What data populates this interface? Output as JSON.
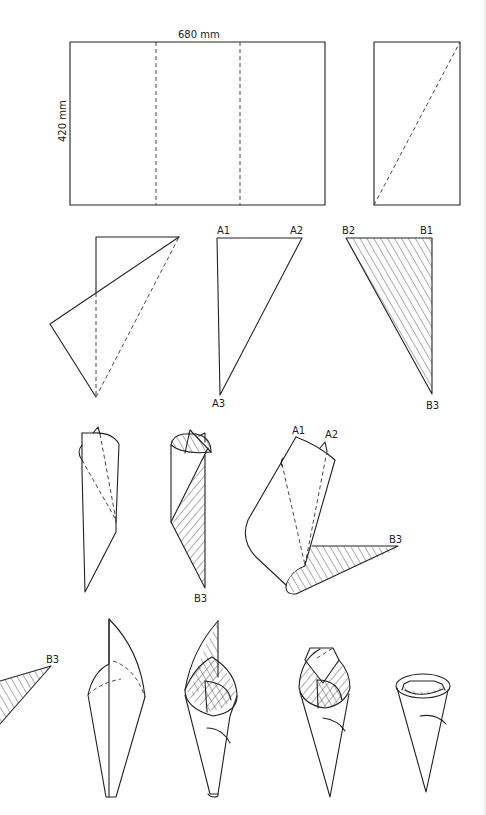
{
  "diagram": {
    "sheet": {
      "width_label": "680 mm",
      "height_label": "420 mm"
    },
    "steps": [
      {
        "id": 1,
        "description": "Sheet divided into thirds by two vertical dashed fold lines"
      },
      {
        "id": 2,
        "description": "One third strip with dashed diagonal fold line"
      },
      {
        "id": 3,
        "description": "Strip folded along diagonal"
      },
      {
        "id": 4,
        "description": "Triangle A",
        "labels": [
          "A1",
          "A2",
          "A3"
        ]
      },
      {
        "id": 5,
        "description": "Hatched triangle B",
        "labels": [
          "B2",
          "B1",
          "B3"
        ]
      },
      {
        "id": 6,
        "description": "Triangle A rolled into a cone"
      },
      {
        "id": 7,
        "description": "Triangle B wrapped around cone",
        "labels": [
          "B3"
        ]
      },
      {
        "id": 8,
        "description": "Cone opened showing A1, A2 and tail B3",
        "labels": [
          "A1",
          "A2",
          "B3"
        ]
      },
      {
        "id": 9,
        "description": "Tail B3 continues wrapping",
        "labels": [
          "B3"
        ]
      },
      {
        "id": 10,
        "description": "Cone with flap upright"
      },
      {
        "id": 11,
        "description": "Flap folded inside cone"
      },
      {
        "id": 12,
        "description": "Top flaps tucked"
      },
      {
        "id": 13,
        "description": "Finished cone"
      }
    ],
    "labels": {
      "a1": "A1",
      "a2": "A2",
      "a3": "A3",
      "b1": "B1",
      "b2": "B2",
      "b3": "B3"
    }
  }
}
